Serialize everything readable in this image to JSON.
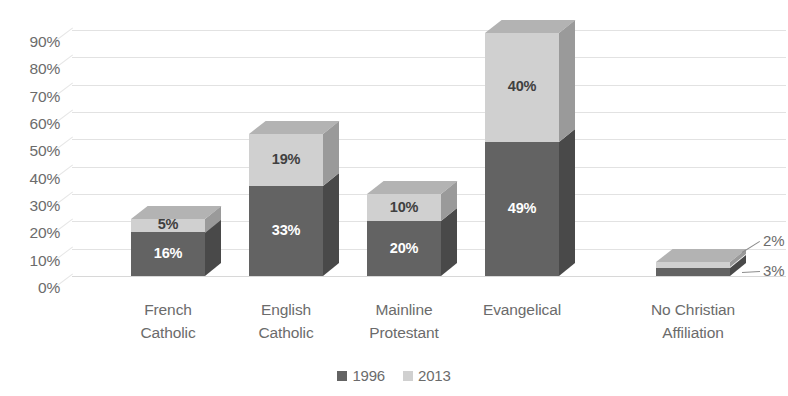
{
  "chart_data": {
    "type": "bar",
    "subtype": "stacked-column-3d",
    "title": "",
    "subtitle": "",
    "xlabel": "",
    "ylabel": "",
    "ylim": [
      0,
      90
    ],
    "y_tick_step": 10,
    "grid": true,
    "legend_position": "bottom",
    "value_format": "percent",
    "categories": [
      "French Catholic",
      "English Catholic",
      "Mainline Protestant",
      "Evangelical",
      "No Christian Affiliation"
    ],
    "category_lines": [
      [
        "French",
        "Catholic"
      ],
      [
        "English",
        "Catholic"
      ],
      [
        "Mainline",
        "Protestant"
      ],
      [
        "Evangelical"
      ],
      [
        "No Christian",
        "Affiliation"
      ]
    ],
    "y_tick_labels": [
      "90%",
      "80%",
      "70%",
      "60%",
      "50%",
      "40%",
      "30%",
      "20%",
      "10%",
      "0%"
    ],
    "y_tick_values": [
      90,
      80,
      70,
      60,
      50,
      40,
      30,
      20,
      10,
      0
    ],
    "series": [
      {
        "name": "1996",
        "color": "#636363",
        "values": [
          16,
          33,
          20,
          49,
          3
        ],
        "labels": [
          "16%",
          "33%",
          "20%",
          "49%",
          "3%"
        ]
      },
      {
        "name": "2013",
        "color": "#d0d0d0",
        "values": [
          5,
          19,
          10,
          40,
          2
        ],
        "labels": [
          "5%",
          "19%",
          "10%",
          "40%",
          "2%"
        ]
      }
    ],
    "callouts": [
      {
        "text": "2%",
        "series": "2013",
        "category": "No Christian Affiliation"
      },
      {
        "text": "3%",
        "series": "1996",
        "category": "No Christian Affiliation"
      }
    ]
  },
  "legend": {
    "items": [
      {
        "label": "1996",
        "color": "#636363"
      },
      {
        "label": "2013",
        "color": "#d0d0d0"
      }
    ]
  },
  "colors": {
    "series_1996": "#636363",
    "series_2013": "#d0d0d0",
    "gridline": "#e2e2e2",
    "axis_text": "#6b6b6b",
    "background": "#ffffff"
  }
}
